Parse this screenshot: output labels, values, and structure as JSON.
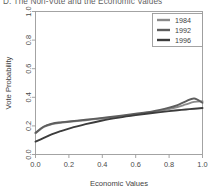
{
  "chart_data": {
    "type": "line",
    "title": "D. The Non-Vote and the Economic Values",
    "xlabel": "Economic Values",
    "ylabel": "Vote Probability",
    "xlim": [
      0.0,
      1.0
    ],
    "ylim": [
      0.0,
      1.0
    ],
    "xticks": [
      "0.0",
      "0.2",
      "0.4",
      "0.6",
      "0.8",
      "1.0"
    ],
    "xtick_values": [
      0.0,
      0.2,
      0.4,
      0.6,
      0.8,
      1.0
    ],
    "yticks": [
      "0.0",
      "0.2",
      "0.4",
      "0.6",
      "0.8",
      "1.0"
    ],
    "ytick_values": [
      0.0,
      0.2,
      0.4,
      0.6,
      0.8,
      1.0
    ],
    "grid": false,
    "legend_position": "top-right",
    "x": [
      0.0,
      0.05,
      0.1,
      0.15,
      0.2,
      0.3,
      0.4,
      0.5,
      0.6,
      0.7,
      0.8,
      0.85,
      0.9,
      0.95,
      1.0
    ],
    "series": [
      {
        "name": "1984",
        "color": "#8a8a8a",
        "values": [
          0.148,
          0.192,
          0.213,
          0.222,
          0.228,
          0.24,
          0.252,
          0.265,
          0.28,
          0.296,
          0.318,
          0.332,
          0.35,
          0.368,
          0.372
        ]
      },
      {
        "name": "1992",
        "color": "#5e5e5e",
        "values": [
          0.152,
          0.196,
          0.216,
          0.225,
          0.231,
          0.243,
          0.256,
          0.27,
          0.285,
          0.302,
          0.328,
          0.346,
          0.372,
          0.392,
          0.362
        ]
      },
      {
        "name": "1996",
        "color": "#3c3c3c",
        "values": [
          0.09,
          0.116,
          0.142,
          0.163,
          0.181,
          0.212,
          0.238,
          0.258,
          0.275,
          0.29,
          0.303,
          0.309,
          0.315,
          0.32,
          0.325
        ]
      }
    ]
  },
  "axes": {
    "x_title": "Economic Values",
    "y_title": "Vote Probability"
  },
  "legend": {
    "entries": [
      {
        "label": "1984"
      },
      {
        "label": "1992"
      },
      {
        "label": "1996"
      }
    ]
  }
}
